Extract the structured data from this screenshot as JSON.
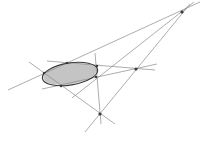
{
  "diagram": {
    "type": "projective-geometry-polar-construction",
    "colors": {
      "background": "#ffffff",
      "lines": "#8a8a8a",
      "ellipse": "#3a3a3a",
      "shaded_region": "#c4c4c4",
      "points": "#3a3a3a"
    },
    "ellipse": {
      "cx": 70,
      "cy": 74,
      "rx": 28,
      "ry": 11,
      "rotation_deg": -9
    },
    "shaded_region": "interior of inscribed quadrilateral / ellipse",
    "points": [
      {
        "id": "P",
        "x": 182,
        "y": 12,
        "role": "diagonal-point"
      },
      {
        "id": "Q",
        "x": 136,
        "y": 69,
        "role": "diagonal-point"
      },
      {
        "id": "R",
        "x": 100,
        "y": 114,
        "role": "diagonal-point"
      },
      {
        "id": "A",
        "x": 44,
        "y": 73,
        "role": "on-ellipse"
      },
      {
        "id": "B",
        "x": 67,
        "y": 63,
        "role": "on-ellipse"
      },
      {
        "id": "C",
        "x": 97,
        "y": 66,
        "role": "on-ellipse"
      },
      {
        "id": "D",
        "x": 96,
        "y": 77,
        "role": "on-ellipse"
      },
      {
        "id": "E",
        "x": 61,
        "y": 86,
        "role": "on-ellipse"
      }
    ],
    "lines": [
      {
        "x1": 8,
        "y1": 90,
        "x2": 200,
        "y2": 2
      },
      {
        "x1": 72,
        "y1": 98,
        "x2": 194,
        "y2": 2
      },
      {
        "x1": 85,
        "y1": 132,
        "x2": 190,
        "y2": 4
      },
      {
        "x1": 47,
        "y1": 61,
        "x2": 155,
        "y2": 70
      },
      {
        "x1": 42,
        "y1": 89,
        "x2": 157,
        "y2": 64
      },
      {
        "x1": 29,
        "y1": 62,
        "x2": 115,
        "y2": 124
      },
      {
        "x1": 95,
        "y1": 53,
        "x2": 101,
        "y2": 124
      }
    ]
  }
}
